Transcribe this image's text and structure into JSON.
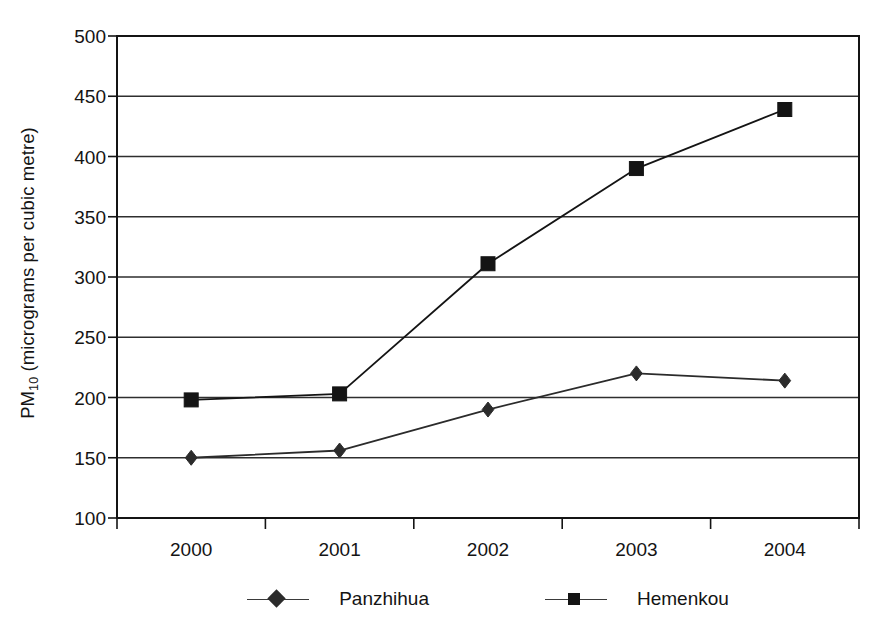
{
  "chart_data": {
    "type": "line",
    "title": "",
    "xlabel": "",
    "ylabel": "PM10 (micrograms per cubic metre)",
    "ylabel_prefix": "PM",
    "ylabel_sub": "10",
    "ylabel_suffix": " (micrograms per cubic metre)",
    "categories": [
      "2000",
      "2001",
      "2002",
      "2003",
      "2004"
    ],
    "x": [
      2000,
      2001,
      2002,
      2003,
      2004
    ],
    "ylim": [
      100,
      500
    ],
    "yticks": [
      500,
      450,
      400,
      350,
      300,
      250,
      200,
      150,
      100
    ],
    "ytick_labels": [
      "500",
      "450",
      "400",
      "350",
      "300",
      "250",
      "200",
      "150",
      "100"
    ],
    "grid": "horizontal",
    "legend_position": "bottom",
    "series": [
      {
        "name": "Panzhihua",
        "marker": "diamond",
        "color": "#2b2b2b",
        "values": [
          150,
          156,
          190,
          220,
          214
        ]
      },
      {
        "name": "Hemenkou",
        "marker": "square",
        "color": "#141414",
        "values": [
          198,
          203,
          311,
          390,
          439
        ]
      }
    ]
  },
  "legend": {
    "entries": [
      {
        "label": "Panzhihua",
        "marker": "diamond-marker-icon"
      },
      {
        "label": "Hemenkou",
        "marker": "square-marker-icon"
      }
    ]
  }
}
